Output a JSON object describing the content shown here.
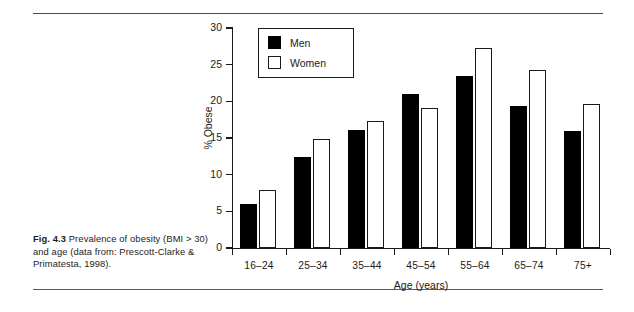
{
  "figure": {
    "label": "Fig. 4.3",
    "caption": "Prevalence of obesity (BMI > 30) and age (data from: Prescott-Clarke & Primatesta, 1998)."
  },
  "chart_data": {
    "type": "bar",
    "title": "",
    "xlabel": "Age (years)",
    "ylabel": "% Obese",
    "categories": [
      "16–24",
      "25–34",
      "35–44",
      "45–54",
      "55–64",
      "65–74",
      "75+"
    ],
    "series": [
      {
        "name": "Men",
        "color": "#000000",
        "values": [
          6.0,
          12.4,
          16.1,
          21.0,
          23.5,
          19.4,
          15.9
        ]
      },
      {
        "name": "Women",
        "color": "#ffffff",
        "values": [
          7.9,
          14.8,
          17.3,
          19.1,
          27.3,
          24.3,
          19.7
        ]
      }
    ],
    "ylim": [
      0,
      30
    ],
    "yticks": [
      0,
      5,
      10,
      15,
      20,
      25,
      30
    ],
    "ytick_labels": [
      "0",
      "5",
      "10",
      "15",
      "20",
      "25",
      "30"
    ],
    "grid": false,
    "legend_position": "top-left",
    "legend_entries": [
      "Men",
      "Women"
    ]
  }
}
